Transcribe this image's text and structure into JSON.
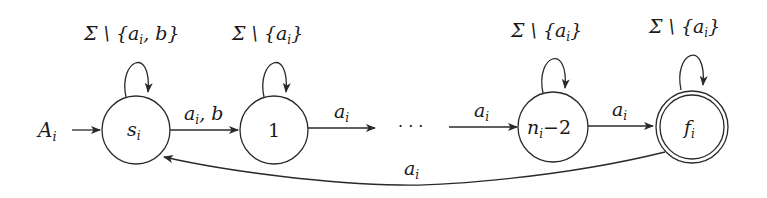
{
  "diagram": {
    "type": "finite-automaton",
    "initial_label": "A",
    "initial_sub": "i",
    "states": [
      {
        "id": "s",
        "label": "s",
        "sub": "i",
        "accepting": false,
        "loop": {
          "main": "Σ \\ {a",
          "sub": "i",
          "tail": ", b}"
        }
      },
      {
        "id": "1",
        "label": "1",
        "sub": "",
        "accepting": false,
        "loop": {
          "main": "Σ \\ {a",
          "sub": "i",
          "tail": "}"
        }
      },
      {
        "id": "n",
        "label": "n",
        "sub": "i",
        "tail": "−2",
        "accepting": false,
        "loop": {
          "main": "Σ \\ {a",
          "sub": "i",
          "tail": "}"
        }
      },
      {
        "id": "f",
        "label": "f",
        "sub": "i",
        "accepting": true,
        "loop": {
          "main": "Σ \\ {a",
          "sub": "i",
          "tail": "}"
        }
      }
    ],
    "ellipsis": "· · ·",
    "edges": [
      {
        "from": "s",
        "to": "1",
        "main": "a",
        "sub": "i",
        "tail": ", b"
      },
      {
        "from": "1",
        "to": "dots",
        "main": "a",
        "sub": "i",
        "tail": ""
      },
      {
        "from": "dots",
        "to": "n",
        "main": "a",
        "sub": "i",
        "tail": ""
      },
      {
        "from": "n",
        "to": "f",
        "main": "a",
        "sub": "i",
        "tail": ""
      },
      {
        "from": "f",
        "to": "s",
        "main": "a",
        "sub": "i",
        "tail": ""
      }
    ]
  }
}
